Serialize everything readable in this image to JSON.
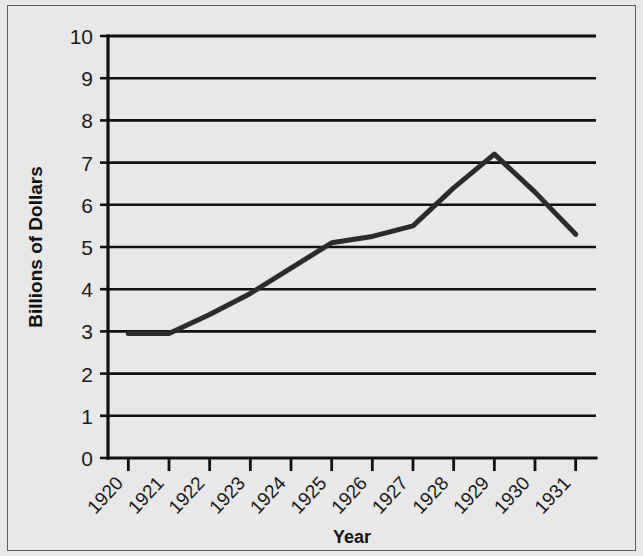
{
  "chart_data": {
    "type": "line",
    "title": "",
    "xlabel": "Year",
    "ylabel": "Billions of Dollars",
    "xlim": [
      1920,
      1931
    ],
    "ylim": [
      0,
      10
    ],
    "grid": "horizontal",
    "legend": "none",
    "line_color": "#2b2b2b",
    "background_color": "#e8e8e8",
    "axis_color": "#111111",
    "categories": [
      "1920",
      "1921",
      "1922",
      "1923",
      "1924",
      "1925",
      "1926",
      "1927",
      "1928",
      "1929",
      "1930",
      "1931"
    ],
    "x_tick_labels": [
      "1920",
      "1921",
      "1922",
      "1923",
      "1924",
      "1925",
      "1926",
      "1927",
      "1928",
      "1929",
      "1930",
      "1931"
    ],
    "y_tick_labels": [
      "0",
      "1",
      "2",
      "3",
      "4",
      "5",
      "6",
      "7",
      "8",
      "9",
      "10"
    ],
    "y_ticks": [
      0,
      1,
      2,
      3,
      4,
      5,
      6,
      7,
      8,
      9,
      10
    ],
    "x": [
      1920,
      1921,
      1922,
      1923,
      1924,
      1925,
      1926,
      1927,
      1928,
      1929,
      1930,
      1931
    ],
    "values": [
      2.95,
      2.95,
      3.4,
      3.9,
      4.5,
      5.1,
      5.25,
      5.5,
      6.4,
      7.2,
      6.3,
      5.3
    ],
    "series": [
      {
        "name": "Billions of Dollars",
        "values": [
          2.95,
          2.95,
          3.4,
          3.9,
          4.5,
          5.1,
          5.25,
          5.5,
          6.4,
          7.2,
          6.3,
          5.3
        ]
      }
    ],
    "peak": {
      "x": 1929,
      "y": 7.2
    },
    "start": {
      "x": 1920,
      "y": 2.95
    },
    "end": {
      "x": 1931,
      "y": 5.3
    }
  },
  "axes": {
    "y_title": "Billions of Dollars",
    "x_title": "Year"
  }
}
